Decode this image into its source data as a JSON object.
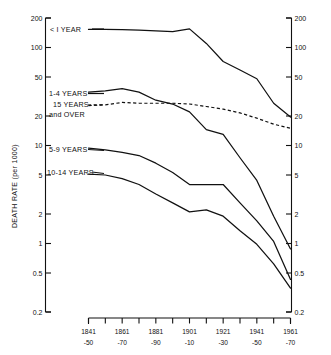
{
  "chart_data": {
    "type": "line",
    "title": "",
    "xlabel": "",
    "ylabel": "DEATH RATE (per 1000)",
    "yscale": "log",
    "ylim": [
      0.2,
      200
    ],
    "grid": false,
    "legend_position": "inline-labels",
    "y_ticks": [
      "200",
      "100",
      "50",
      "20",
      "10",
      "5",
      "2",
      "1",
      "0.5",
      "0.2"
    ],
    "y_tick_values": [
      200,
      100,
      50,
      20,
      10,
      5,
      2,
      1,
      0.5,
      0.2
    ],
    "right_axis_ticks": [
      "200",
      "100",
      "50",
      "20",
      "10",
      "5",
      "2",
      "1",
      "0.5",
      "0.2"
    ],
    "categories": [
      "1841-50",
      "1851-60",
      "1861-70",
      "1871-80",
      "1881-90",
      "1891-1900",
      "1901-10",
      "1911-20",
      "1921-30",
      "1931-40",
      "1941-50",
      "1951-60",
      "1961-70"
    ],
    "x_tick_labels": [
      {
        "top": "1841",
        "bottom": "-50"
      },
      {
        "top": "1861",
        "bottom": "-70"
      },
      {
        "top": "1881",
        "bottom": "-90"
      },
      {
        "top": "1901",
        "bottom": "-10"
      },
      {
        "top": "1921",
        "bottom": "-30"
      },
      {
        "top": "1941",
        "bottom": "-50"
      },
      {
        "top": "1961",
        "bottom": "-70"
      }
    ],
    "series": [
      {
        "name": "< 1 YEAR",
        "label": "< I YEAR",
        "style": "solid",
        "values": [
          153,
          153,
          152,
          150,
          148,
          145,
          155,
          110,
          72,
          59,
          48,
          27,
          19.5
        ]
      },
      {
        "name": "1-4 YEARS",
        "label": "1-4 YEARS",
        "style": "solid",
        "values": [
          35,
          36,
          38,
          35,
          29,
          26.5,
          22,
          14.5,
          13,
          7.5,
          4.4,
          1.9,
          0.88
        ]
      },
      {
        "name": "15 YEARS and OVER",
        "label": "15 YEARS and OVER",
        "style": "dashed",
        "values": [
          25.5,
          26,
          27.5,
          27,
          27,
          27,
          26.5,
          25,
          23.5,
          21.5,
          19,
          16.5,
          15
        ]
      },
      {
        "name": "5-9 YEARS",
        "label": "5-9 YEARS",
        "style": "solid",
        "values": [
          9.4,
          9.0,
          8.5,
          7.9,
          6.6,
          5.3,
          4.0,
          4.0,
          4.0,
          2.6,
          1.7,
          1.05,
          0.43
        ]
      },
      {
        "name": "10-14 YEARS",
        "label": "10-14 YEARS",
        "style": "solid",
        "values": [
          5.1,
          5.0,
          4.6,
          4.0,
          3.2,
          2.6,
          2.1,
          2.2,
          1.9,
          1.35,
          0.98,
          0.62,
          0.35
        ]
      }
    ]
  },
  "axis": {
    "y_title": "DEATH RATE (per 1000)"
  },
  "labels": {
    "under_one": "< I YEAR",
    "one_to_four": "1-4 YEARS",
    "fifteen_over_line1": "15 YEARS",
    "fifteen_over_line2": "and OVER",
    "five_to_nine": "5-9 YEARS",
    "ten_to_fourteen": "10-14 YEARS"
  },
  "colors": {
    "ink": "#111111",
    "paper": "#ffffff"
  }
}
